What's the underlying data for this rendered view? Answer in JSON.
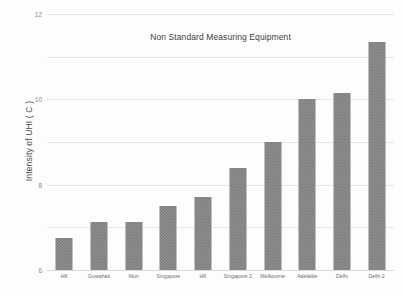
{
  "chart_data": {
    "type": "bar",
    "title": "Non Standard Measuring Equipment",
    "xlabel": "",
    "ylabel": "Intensity of UHI ( C )",
    "categories": [
      "HK",
      "Guwahati",
      "Murr",
      "Singapore",
      "HK",
      "Singapore 2",
      "Melbourne",
      "Adelaide",
      "Delhi",
      "Delhi 2"
    ],
    "values": [
      1.5,
      2.25,
      2.25,
      3.0,
      3.4,
      4.8,
      6.0,
      8.0,
      8.3,
      10.7
    ],
    "ylim": [
      0,
      12
    ],
    "ytick_labels": [
      "0",
      "2",
      "4",
      "6",
      "8",
      "10",
      "12"
    ],
    "ytick_values": [
      0,
      2,
      4,
      6,
      8,
      10,
      12
    ],
    "grid": true,
    "grid_axis": "y",
    "legend": false,
    "bar_color": "#7e7e7e",
    "grid_color": "#e6e6e6",
    "background_color": "#fdfdfd"
  }
}
